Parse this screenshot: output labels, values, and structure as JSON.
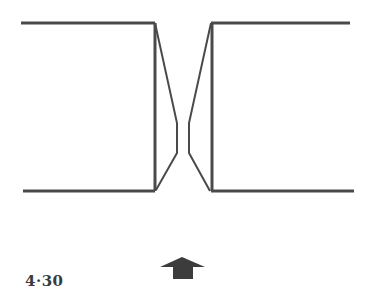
{
  "figure": {
    "label": "4·30",
    "stroke_color": "#4a4a4a",
    "arrow_color": "#3c3c3c",
    "arrow_direction": "up"
  }
}
